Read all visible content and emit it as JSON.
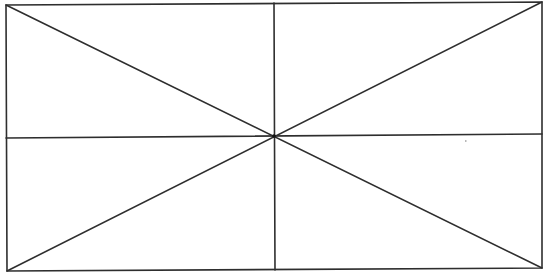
{
  "diagram": {
    "type": "geometric-figure",
    "canvas": {
      "width": 548,
      "height": 273,
      "background": "#ffffff"
    },
    "stroke": {
      "color": "#2e2e2e",
      "width": 1.6
    },
    "rectangle": {
      "top_left": [
        6,
        5
      ],
      "top_right": [
        542,
        2
      ],
      "bottom_right": [
        542,
        268
      ],
      "bottom_left": [
        7,
        271
      ]
    },
    "center": [
      274,
      136
    ],
    "lines": [
      {
        "name": "vertical-midline",
        "from": [
          274,
          3
        ],
        "to": [
          275,
          270
        ]
      },
      {
        "name": "horizontal-midline",
        "from": [
          6,
          138
        ],
        "to": [
          542,
          134
        ]
      },
      {
        "name": "diagonal-top-left-to-bottom-right",
        "from": [
          6,
          5
        ],
        "to": [
          542,
          268
        ]
      },
      {
        "name": "diagonal-bottom-left-to-top-right",
        "from": [
          7,
          271
        ],
        "to": [
          542,
          2
        ]
      }
    ],
    "speck": {
      "position": [
        465,
        140
      ],
      "color": "#b8b8b8"
    }
  }
}
